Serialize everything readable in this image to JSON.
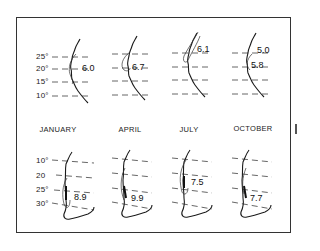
{
  "figure": {
    "months": [
      "JANUARY",
      "APRIL",
      "JULY",
      "OCTOBER"
    ],
    "top_row": {
      "latitude_labels": [
        "25°",
        "20°",
        "15°",
        "10°"
      ],
      "values": [
        {
          "month": "JANUARY",
          "labels": [
            "6.0"
          ]
        },
        {
          "month": "APRIL",
          "labels": [
            "6.7"
          ]
        },
        {
          "month": "JULY",
          "labels": [
            "6.1"
          ]
        },
        {
          "month": "OCTOBER",
          "labels": [
            "5.0",
            "5.8"
          ]
        }
      ]
    },
    "bottom_row": {
      "latitude_labels": [
        "10°",
        "20",
        "25°",
        "30°"
      ],
      "values": [
        {
          "month": "JANUARY",
          "labels": [
            "8.9"
          ]
        },
        {
          "month": "APRIL",
          "labels": [
            "9.9"
          ]
        },
        {
          "month": "JULY",
          "labels": [
            "7.5"
          ]
        },
        {
          "month": "OCTOBER",
          "labels": [
            "7.7"
          ]
        }
      ]
    },
    "colors": {
      "line": "#1a1a1a",
      "dash": "#555555",
      "background": "#ffffff"
    }
  }
}
